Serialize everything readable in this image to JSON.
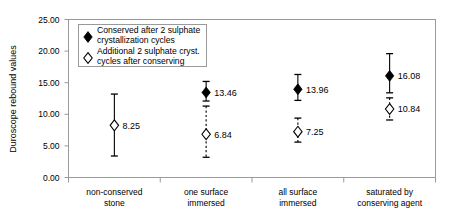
{
  "chart_data": {
    "type": "scatter",
    "title": "",
    "xlabel": "",
    "ylabel": "Duroscope rebound values",
    "ylim": [
      0,
      25
    ],
    "ytick_labels": [
      "0.00",
      "5.00",
      "10.00",
      "15.00",
      "20.00",
      "25.00"
    ],
    "ytick_values": [
      0,
      5,
      10,
      15,
      20,
      25
    ],
    "grid": false,
    "legend_position": "top-left",
    "categories": [
      "non-conserved stone",
      "one surface immersed",
      "all surface immersed",
      "saturated by conserving agent"
    ],
    "category_lines": [
      [
        "non-conserved",
        "stone"
      ],
      [
        "one surface",
        "immersed"
      ],
      [
        "all surface",
        "immersed"
      ],
      [
        "saturated by",
        "conserving agent"
      ]
    ],
    "series": [
      {
        "name": "Conserved after 2 sulphate crystallization cycles",
        "name_lines": [
          "Conserved after 2 sulphate",
          "crystallization cycles"
        ],
        "marker": "filled-diamond",
        "errorbar_style": "solid",
        "points": [
          {
            "category": "non-conserved stone",
            "value": null,
            "label": "",
            "low": null,
            "high": null
          },
          {
            "category": "one surface immersed",
            "value": 13.46,
            "label": "13.46",
            "low": 12.1,
            "high": 15.2
          },
          {
            "category": "all surface immersed",
            "value": 13.96,
            "label": "13.96",
            "low": 12.2,
            "high": 16.3
          },
          {
            "category": "saturated by conserving agent",
            "value": 16.08,
            "label": "16.08",
            "low": 13.4,
            "high": 19.6
          }
        ]
      },
      {
        "name": "Additional 2 sulphate cryst. cycles after conserving",
        "name_lines": [
          "Additional 2 sulphate cryst.",
          "cycles after conserving"
        ],
        "marker": "open-diamond",
        "errorbar_style": "dashed",
        "points": [
          {
            "category": "non-conserved stone",
            "value": 8.25,
            "label": "8.25",
            "low": 3.4,
            "high": 13.2
          },
          {
            "category": "one surface immersed",
            "value": 6.84,
            "label": "6.84",
            "low": 3.2,
            "high": 11.3
          },
          {
            "category": "all surface immersed",
            "value": 7.25,
            "label": "7.25",
            "low": 5.6,
            "high": 9.4
          },
          {
            "category": "saturated by conserving agent",
            "value": 10.84,
            "label": "10.84",
            "low": 9.1,
            "high": 12.6
          }
        ]
      }
    ],
    "first_group_marker_override": {
      "category": "non-conserved stone",
      "errorbar_style": "solid",
      "note": "solid error bar with open marker"
    }
  }
}
